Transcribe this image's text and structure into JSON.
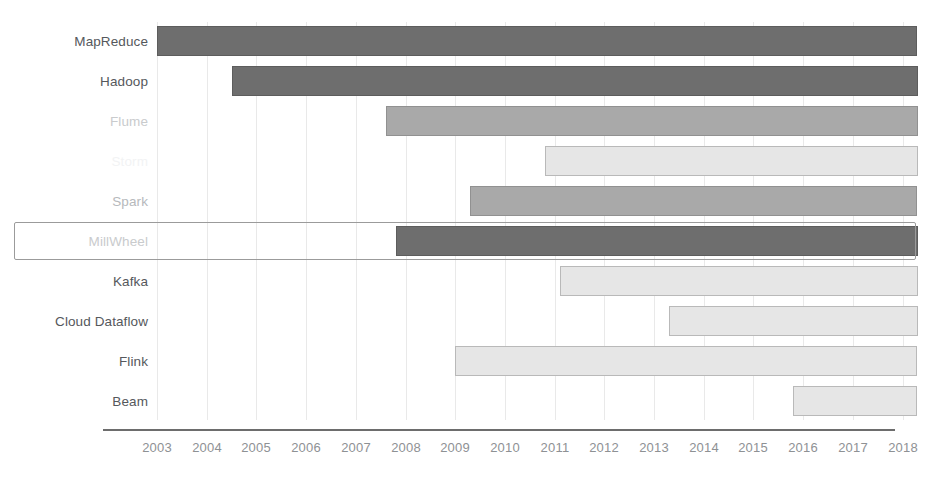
{
  "chart_data": {
    "type": "bar",
    "subtype": "gantt-timeline",
    "title": "",
    "xlabel": "",
    "ylabel": "",
    "xlim": [
      2002.4,
      2018.45
    ],
    "grid": true,
    "grid_axis": "x",
    "legend": "none",
    "x_ticks": [
      "2003",
      "2004",
      "2005",
      "2006",
      "2007",
      "2008",
      "2009",
      "2010",
      "2011",
      "2012",
      "2013",
      "2014",
      "2015",
      "2016",
      "2017",
      "2018"
    ],
    "categories": [
      "MapReduce",
      "Hadoop",
      "Flume",
      "Storm",
      "Spark",
      "MillWheel",
      "Kafka",
      "Cloud Dataflow",
      "Flink",
      "Beam"
    ],
    "bars": [
      {
        "label": "MapReduce",
        "start": 2003.0,
        "end": 2018.3,
        "shade": "dark",
        "label_style": "normal"
      },
      {
        "label": "Hadoop",
        "start": 2004.5,
        "end": 2018.3,
        "shade": "dark",
        "label_style": "normal"
      },
      {
        "label": "Flume",
        "start": 2007.6,
        "end": 2018.3,
        "shade": "mid",
        "label_style": "faint"
      },
      {
        "label": "Storm",
        "start": 2010.8,
        "end": 2018.3,
        "shade": "light",
        "label_style": "faint2"
      },
      {
        "label": "Spark",
        "start": 2009.3,
        "end": 2018.3,
        "shade": "mid",
        "label_style": "mid"
      },
      {
        "label": "MillWheel",
        "start": 2007.8,
        "end": 2018.3,
        "shade": "dark",
        "label_style": "faint",
        "highlighted": true
      },
      {
        "label": "Kafka",
        "start": 2011.1,
        "end": 2018.3,
        "shade": "light",
        "label_style": "normal"
      },
      {
        "label": "Cloud Dataflow",
        "start": 2013.3,
        "end": 2018.3,
        "shade": "light",
        "label_style": "normal"
      },
      {
        "label": "Flink",
        "start": 2009.0,
        "end": 2018.3,
        "shade": "light",
        "label_style": "normal"
      },
      {
        "label": "Beam",
        "start": 2015.8,
        "end": 2018.3,
        "shade": "light",
        "label_style": "normal"
      }
    ]
  },
  "colors": {
    "dark": "#6e6e6e",
    "mid": "#a9a9a9",
    "light": "#e6e6e6",
    "axis": "#6d6d6d",
    "grid": "#e9e9e9",
    "label": "#55585c",
    "tick": "#8e9194",
    "highlight_border": "#9b9b9b"
  },
  "caption": {
    "text": ""
  }
}
